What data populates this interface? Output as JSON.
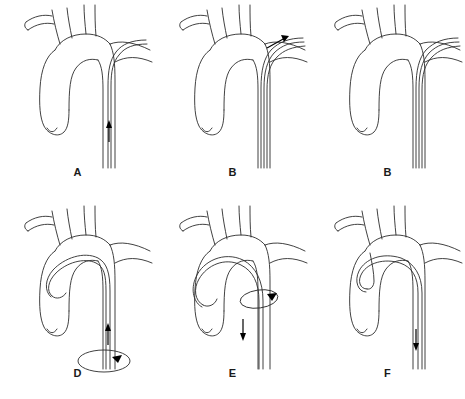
{
  "figure": {
    "background_color": "#ffffff",
    "line_color": "#2b2b2b",
    "arrow_color": "#000000",
    "rows": 2,
    "columns": 3
  },
  "panels": [
    {
      "label": "A",
      "caption": "Catheter advanced up the descending thoracic aorta",
      "arrows": [
        {
          "name": "catheter-advance-arrow",
          "direction": "up",
          "location": "descending-aorta"
        }
      ],
      "torque_ellipses": []
    },
    {
      "label": "B",
      "caption": "Catheter tip directed into the left subclavian artery",
      "arrows": [
        {
          "name": "subclavian-entry-arrow",
          "direction": "up-right",
          "location": "left-subclavian-artery"
        }
      ],
      "torque_ellipses": []
    },
    {
      "label": "B",
      "caption": "Catheter seated in the left subclavian artery, no arrow",
      "arrows": [],
      "torque_ellipses": []
    },
    {
      "label": "D",
      "caption": "Catheter looped over the arch into the ascending aorta while torqued",
      "arrows": [
        {
          "name": "catheter-advance-arrow",
          "direction": "up",
          "location": "descending-aorta"
        },
        {
          "name": "rotation-arrowhead",
          "direction": "clockwise",
          "location": "catheter-shaft"
        }
      ],
      "torque_ellipses": [
        {
          "name": "shaft-rotation-ellipse",
          "location": "catheter-shaft-below-arch"
        }
      ]
    },
    {
      "label": "E",
      "caption": "Catheter withdrawn and rotated to form the arch loop",
      "arrows": [
        {
          "name": "catheter-withdraw-arrow",
          "direction": "down",
          "location": "descending-aorta"
        },
        {
          "name": "rotation-arrowhead",
          "direction": "clockwise",
          "location": "catheter-at-arch"
        }
      ],
      "torque_ellipses": [
        {
          "name": "arch-rotation-ellipse",
          "location": "catheter-at-arch"
        }
      ]
    },
    {
      "label": "F",
      "caption": "Catheter tip engaged in the brachiocephalic trunk",
      "arrows": [
        {
          "name": "catheter-withdraw-arrow",
          "direction": "down",
          "location": "descending-aorta"
        }
      ],
      "torque_ellipses": []
    }
  ]
}
